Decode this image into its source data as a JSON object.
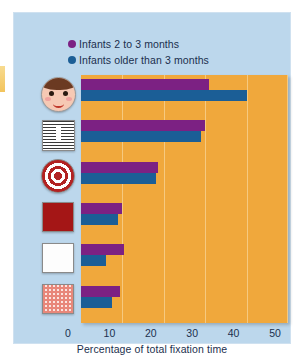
{
  "figure": {
    "panel_color": "#bcd7ec",
    "plot_color": "#f0a83c"
  },
  "legend": {
    "position": "top-left",
    "items": [
      {
        "label": "Infants 2 to 3 months",
        "color": "#7c2183",
        "icon": "legend-dot-purple"
      },
      {
        "label": "Infants older than 3 months",
        "color": "#1b5e96",
        "icon": "legend-dot-blue"
      }
    ]
  },
  "axis": {
    "x_title": "Percentage of total fixation time",
    "x_ticks": [
      "0",
      "10",
      "20",
      "30",
      "40",
      "50"
    ]
  },
  "categories": [
    {
      "icon": "face-icon",
      "name": "human-face-stimulus"
    },
    {
      "icon": "newsprint-icon",
      "name": "newsprint-stimulus"
    },
    {
      "icon": "bullseye-icon",
      "name": "bullseye-stimulus"
    },
    {
      "icon": "red-square-icon",
      "name": "solid-red-stimulus"
    },
    {
      "icon": "white-square-icon",
      "name": "plain-white-stimulus"
    },
    {
      "icon": "checkered-square-icon",
      "name": "checkered-stimulus"
    }
  ],
  "chart_data": {
    "type": "bar",
    "orientation": "horizontal",
    "title": "",
    "xlabel": "Percentage of total fixation time",
    "ylabel": "",
    "xlim": [
      0,
      50
    ],
    "xticks": [
      0,
      10,
      20,
      30,
      40,
      50
    ],
    "grid": true,
    "legend_position": "top-left",
    "categories": [
      "Human face",
      "Newsprint",
      "Bullseye",
      "Solid red",
      "Plain white",
      "Checkered"
    ],
    "series": [
      {
        "name": "Infants 2 to 3 months",
        "color": "#7c2183",
        "values": [
          31,
          30,
          18.5,
          10,
          10.5,
          9.5
        ]
      },
      {
        "name": "Infants older than 3 months",
        "color": "#1b5e96",
        "values": [
          40,
          29,
          18,
          9,
          6,
          7.5
        ]
      }
    ]
  }
}
